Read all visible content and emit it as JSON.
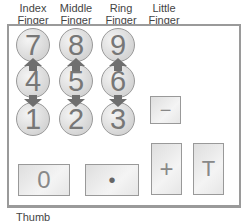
{
  "finger_labels": [
    {
      "line1": "Index",
      "line2": "Finger"
    },
    {
      "line1": "Middle",
      "line2": "Finger"
    },
    {
      "line1": "Ring",
      "line2": "Finger"
    },
    {
      "line1": "Little",
      "line2": "Finger"
    }
  ],
  "keypad": {
    "digit_keys": [
      "7",
      "8",
      "9",
      "4",
      "5",
      "6",
      "1",
      "2",
      "3"
    ],
    "zero_key": "0",
    "decimal_key": "•",
    "minus_key": "−",
    "plus_key": "+",
    "total_key": "T"
  },
  "thumb_label": "Thumb",
  "colors": {
    "arrow": "#6f6f6f",
    "border": "#999999"
  }
}
